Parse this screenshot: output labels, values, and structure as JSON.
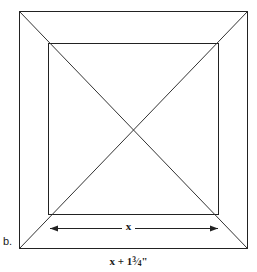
{
  "figure": {
    "part_label": "b.",
    "background_color": "#ffffff",
    "stroke_color": "#222222",
    "text_color": "#1a1a1a",
    "outer_square": {
      "name": "outer-square",
      "x": 19,
      "y": 11,
      "width": 228,
      "height": 237
    },
    "inner_square": {
      "name": "inner-square",
      "x": 48,
      "y": 43,
      "width": 170,
      "height": 171
    },
    "diagonals": [
      {
        "name": "diagonal-top-left-to-bottom-right",
        "x1": 19,
        "y1": 11,
        "x2": 247,
        "y2": 248
      },
      {
        "name": "diagonal-top-right-to-bottom-left",
        "x1": 247,
        "y1": 11,
        "x2": 19,
        "y2": 248
      }
    ],
    "center_point": {
      "x": 133,
      "y": 129
    },
    "inner_dimension": {
      "label": "x",
      "arrow_y": 228,
      "arrow_x1": 50,
      "arrow_x2": 218
    },
    "outer_dimension": {
      "label_prefix": "x + 1",
      "fraction_numerator": "3",
      "fraction_denominator": "4",
      "label_suffix": "\"",
      "label_plain": "x + 1¾\""
    }
  }
}
